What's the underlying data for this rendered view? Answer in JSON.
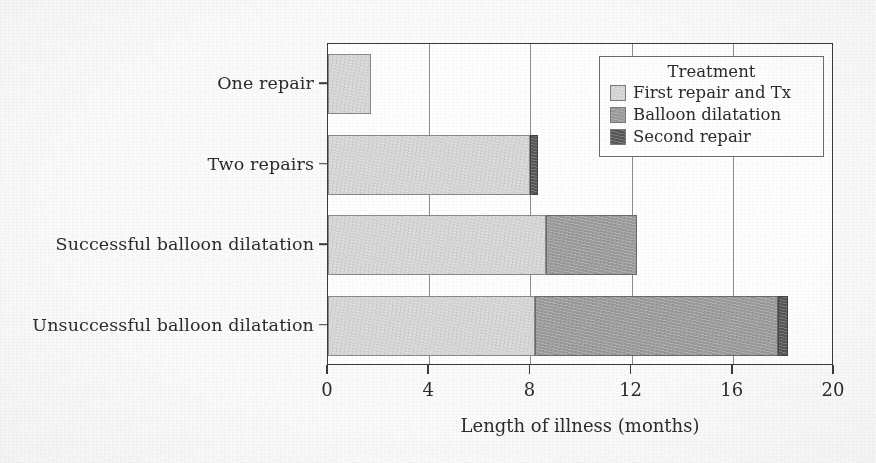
{
  "chart_data": {
    "type": "bar",
    "orientation": "horizontal",
    "stacked": true,
    "title": "",
    "xlabel": "Length of illness (months)",
    "ylabel": "",
    "xlim": [
      0,
      20
    ],
    "xticks": [
      0,
      4,
      8,
      12,
      16,
      20
    ],
    "xtick_labels": [
      "0",
      "4",
      "8",
      "12",
      "16",
      "20"
    ],
    "grid": "vertical",
    "categories": [
      "One repair",
      "Two repairs",
      "Successful balloon dilatation",
      "Unsuccessful balloon dilatation"
    ],
    "legend_title": "Treatment",
    "legend_position": "upper right",
    "series": [
      {
        "name": "First repair and Tx",
        "color": "#d7d7d7",
        "values": [
          1.7,
          8.0,
          8.6,
          8.2
        ]
      },
      {
        "name": "Balloon dilatation",
        "color": "#9c9c9c",
        "values": [
          0,
          0,
          3.6,
          9.6
        ]
      },
      {
        "name": "Second repair",
        "color": "#575757",
        "values": [
          0,
          0.3,
          0,
          0.4
        ]
      }
    ],
    "totals": [
      1.7,
      8.3,
      12.2,
      18.2
    ]
  },
  "legend": {
    "title": "Treatment",
    "items": [
      {
        "label": "First repair and Tx",
        "color": "#d7d7d7"
      },
      {
        "label": "Balloon dilatation",
        "color": "#9c9c9c"
      },
      {
        "label": "Second repair",
        "color": "#575757"
      }
    ]
  },
  "axes": {
    "x_title": "Length of illness (months)",
    "x_tick_labels": [
      "0",
      "4",
      "8",
      "12",
      "16",
      "20"
    ],
    "y_tick_labels": [
      "One repair",
      "Two repairs",
      "Successful balloon dilatation",
      "Unsuccessful balloon dilatation"
    ]
  }
}
